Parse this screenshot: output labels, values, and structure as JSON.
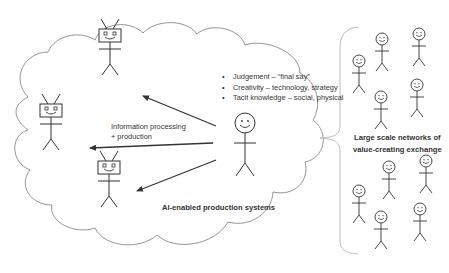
{
  "diagram": {
    "cloud": {
      "label": "AI-enabled production systems",
      "bullets": [
        "Judgement – “final say”",
        "Creativity – technology, strategy",
        "Tacit knowledge – social, physical"
      ],
      "arrow_label_line1": "Information processing",
      "arrow_label_line2": "+ production",
      "robots": [
        {
          "id": "robot-top",
          "x": 110,
          "y": 38
        },
        {
          "id": "robot-left",
          "x": 51,
          "y": 113
        },
        {
          "id": "robot-bottom",
          "x": 109,
          "y": 165
        }
      ],
      "human": {
        "id": "human-center",
        "x": 245,
        "y": 115
      }
    },
    "network": {
      "label_line1": "Large scale networks of",
      "label_line2": "value-creating exchange",
      "people_count": 10
    },
    "colors": {
      "stroke": "#333333",
      "cloud_outline": "#888888",
      "brace": "#bbbbbb",
      "text": "#333333"
    }
  }
}
